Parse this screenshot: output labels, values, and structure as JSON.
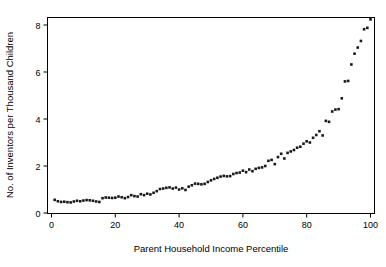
{
  "chart_data": {
    "type": "scatter",
    "title": "",
    "xlabel": "Parent Household Income Percentile",
    "ylabel": "No. of Inventors per Thousand Children",
    "xlim": [
      0,
      101
    ],
    "ylim": [
      0,
      8.6
    ],
    "xticks": [
      0,
      20,
      40,
      60,
      80,
      100
    ],
    "xtick_labels": [
      "0",
      "20",
      "40",
      "60",
      "80",
      "100"
    ],
    "yticks": [
      0,
      2,
      4,
      6,
      8
    ],
    "ytick_labels": [
      "0",
      "2",
      "4",
      "6",
      "8"
    ],
    "grid": false,
    "legend": "none",
    "marker_color": "#1a1a1a",
    "marker_shape": "square",
    "x": [
      1,
      2,
      3,
      4,
      5,
      6,
      7,
      8,
      9,
      10,
      11,
      12,
      13,
      14,
      15,
      16,
      17,
      18,
      19,
      20,
      21,
      22,
      23,
      24,
      25,
      26,
      27,
      28,
      29,
      30,
      31,
      32,
      33,
      34,
      35,
      36,
      37,
      38,
      39,
      40,
      41,
      42,
      43,
      44,
      45,
      46,
      47,
      48,
      49,
      50,
      51,
      52,
      53,
      54,
      55,
      56,
      57,
      58,
      59,
      60,
      61,
      62,
      63,
      64,
      65,
      66,
      67,
      68,
      69,
      70,
      71,
      72,
      73,
      74,
      75,
      76,
      77,
      78,
      79,
      80,
      81,
      82,
      83,
      84,
      85,
      86,
      87,
      88,
      89,
      90,
      91,
      92,
      93,
      94,
      95,
      96,
      97,
      98,
      99,
      100
    ],
    "y": [
      0.56,
      0.5,
      0.47,
      0.48,
      0.46,
      0.45,
      0.49,
      0.52,
      0.5,
      0.53,
      0.55,
      0.54,
      0.52,
      0.49,
      0.47,
      0.63,
      0.66,
      0.65,
      0.64,
      0.65,
      0.7,
      0.67,
      0.63,
      0.68,
      0.76,
      0.72,
      0.7,
      0.8,
      0.76,
      0.82,
      0.79,
      0.86,
      0.93,
      1.02,
      1.04,
      1.07,
      1.09,
      1.04,
      1.08,
      1.0,
      1.05,
      0.98,
      1.12,
      1.18,
      1.25,
      1.24,
      1.22,
      1.24,
      1.32,
      1.39,
      1.45,
      1.5,
      1.55,
      1.58,
      1.56,
      1.57,
      1.66,
      1.7,
      1.72,
      1.8,
      1.74,
      1.85,
      1.78,
      1.88,
      1.92,
      1.94,
      2.0,
      2.22,
      2.26,
      2.08,
      2.38,
      2.52,
      2.32,
      2.56,
      2.62,
      2.68,
      2.78,
      2.82,
      2.95,
      3.05,
      3.0,
      3.2,
      3.32,
      3.48,
      3.3,
      3.92,
      3.88,
      4.32,
      4.4,
      4.42,
      4.88,
      5.6,
      5.62,
      6.32,
      6.78,
      7.04,
      7.32,
      7.82,
      7.88,
      8.24
    ]
  },
  "axes": {
    "x_axis_name": "x-axis",
    "y_axis_name": "y-axis"
  }
}
